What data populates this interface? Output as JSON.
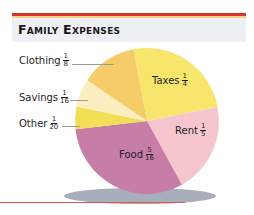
{
  "header": {
    "title": "Family Expenses"
  },
  "colors": {
    "top_rule": "#d9312b",
    "title_bg": "#eef0f6",
    "bottom_rule": "#e05550",
    "clothing": "#f6cc68",
    "savings": "#fbeec0",
    "other": "#f3df55",
    "food": "#c77ea6",
    "rent": "#f6c6ce",
    "taxes": "#f7e56c",
    "shadow": "#a9afba"
  },
  "labels": {
    "clothing": {
      "name": "Clothing",
      "num": "1",
      "den": "8"
    },
    "savings": {
      "name": "Savings",
      "num": "1",
      "den": "16"
    },
    "other": {
      "name": "Other",
      "num": "1",
      "den": "20"
    },
    "taxes": {
      "name": "Taxes",
      "num": "1",
      "den": "4"
    },
    "rent": {
      "name": "Rent",
      "num": "1",
      "den": "5"
    },
    "food": {
      "name": "Food",
      "num": "5",
      "den": "16"
    }
  },
  "chart_data": {
    "type": "pie",
    "title": "Family Expenses",
    "categories": [
      "Taxes",
      "Rent",
      "Food",
      "Other",
      "Savings",
      "Clothing"
    ],
    "values": [
      0.25,
      0.2,
      0.3125,
      0.05,
      0.0625,
      0.125
    ],
    "value_labels": [
      "1/4",
      "1/5",
      "5/16",
      "1/20",
      "1/16",
      "1/8"
    ],
    "legend": "none (direct labels)"
  }
}
